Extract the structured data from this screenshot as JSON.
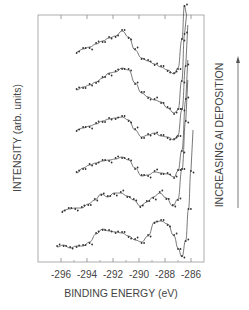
{
  "chart_data": {
    "type": "line",
    "title": "",
    "xlabel": "BINDING ENERGY (eV)",
    "ylabel": "INTENSITY (arb. units)",
    "right_annotation": "INCREASING Al DEPOSITION",
    "x_ticks": [
      -296,
      -294,
      -292,
      -290,
      -288,
      -286
    ],
    "x_tick_labels": [
      "-296",
      "-294",
      "-292",
      "-290",
      "-288",
      "-286"
    ],
    "xlim": [
      -297.7,
      -284.8
    ],
    "y_ticks_labeled": false,
    "grid": false,
    "legend": null,
    "series_order_note": "bottom to top = increasing Al deposition",
    "series": [
      {
        "name": "spectrum 1 (bottom)",
        "offset_px": 0,
        "x": [
          -296.3,
          -295.8,
          -295.3,
          -294.8,
          -294.3,
          -293.8,
          -293.3,
          -292.8,
          -292.3,
          -291.8,
          -291.3,
          -290.8,
          -290.3,
          -289.8,
          -289.3,
          -288.8,
          -288.3,
          -287.8,
          -287.3,
          -287.0,
          -286.7,
          -286.4,
          -286.2,
          -286.0
        ],
        "y_px": [
          247,
          245,
          248,
          246,
          246,
          242,
          234,
          229,
          231,
          232,
          233,
          236,
          240,
          242,
          236,
          222,
          221,
          224,
          236,
          248,
          257,
          240,
          210,
          170
        ]
      },
      {
        "name": "spectrum 2",
        "offset_px": 0,
        "x": [
          -295.9,
          -295.4,
          -294.9,
          -294.4,
          -293.9,
          -293.4,
          -292.9,
          -292.4,
          -291.9,
          -291.4,
          -290.9,
          -290.4,
          -289.9,
          -289.4,
          -288.9,
          -288.4,
          -287.9,
          -287.4,
          -287.0,
          -286.7,
          -286.4
        ],
        "y_px": [
          211,
          209,
          208,
          208,
          204,
          200,
          194,
          197,
          193,
          193,
          196,
          200,
          206,
          202,
          197,
          193,
          198,
          206,
          199,
          170,
          120
        ]
      },
      {
        "name": "spectrum 3",
        "offset_px": 0,
        "x": [
          -294.8,
          -294.3,
          -293.8,
          -293.3,
          -292.8,
          -292.3,
          -291.8,
          -291.3,
          -290.8,
          -290.3,
          -289.8,
          -289.3,
          -288.8,
          -288.3,
          -287.8,
          -287.3,
          -287.0,
          -286.7,
          -286.4
        ],
        "y_px": [
          173,
          168,
          165,
          163,
          161,
          160,
          159,
          157,
          160,
          168,
          176,
          175,
          172,
          173,
          174,
          177,
          171,
          150,
          100
        ]
      },
      {
        "name": "spectrum 4",
        "offset_px": 0,
        "x": [
          -294.8,
          -294.3,
          -293.8,
          -293.3,
          -292.8,
          -292.3,
          -291.8,
          -291.3,
          -290.8,
          -290.3,
          -289.8,
          -289.3,
          -288.8,
          -288.3,
          -287.8,
          -287.3,
          -287.0,
          -286.7,
          -286.4
        ],
        "y_px": [
          130,
          128,
          126,
          124,
          121,
          119,
          118,
          117,
          120,
          130,
          137,
          135,
          133,
          136,
          137,
          140,
          135,
          110,
          65
        ]
      },
      {
        "name": "spectrum 5",
        "offset_px": 0,
        "x": [
          -294.8,
          -294.3,
          -293.8,
          -293.3,
          -292.8,
          -292.3,
          -291.8,
          -291.3,
          -290.8,
          -290.3,
          -289.8,
          -289.3,
          -288.8,
          -288.3,
          -287.8,
          -287.3,
          -287.0,
          -286.7,
          -286.5
        ],
        "y_px": [
          90,
          87,
          85,
          82,
          78,
          73,
          72,
          68,
          70,
          83,
          93,
          97,
          100,
          102,
          108,
          113,
          110,
          80,
          35
        ]
      },
      {
        "name": "spectrum 6 (top)",
        "offset_px": 0,
        "x": [
          -294.8,
          -294.3,
          -293.8,
          -293.3,
          -292.8,
          -292.3,
          -291.8,
          -291.3,
          -290.8,
          -290.3,
          -289.8,
          -289.3,
          -288.8,
          -288.3,
          -287.8,
          -287.3,
          -287.0,
          -286.7,
          -286.5
        ],
        "y_px": [
          52,
          49,
          47,
          44,
          41,
          38,
          36,
          31,
          37,
          50,
          58,
          61,
          64,
          67,
          70,
          74,
          68,
          40,
          5
        ]
      }
    ]
  },
  "plot": {
    "frame": {
      "left": 38,
      "top": 15,
      "right": 204,
      "bottom": 262
    },
    "x_px_at_minus296": 61,
    "px_per_eV": 13,
    "colors": {
      "line": "#555555",
      "marker": "#333333",
      "frame": "#888888",
      "text": "#444444"
    }
  }
}
